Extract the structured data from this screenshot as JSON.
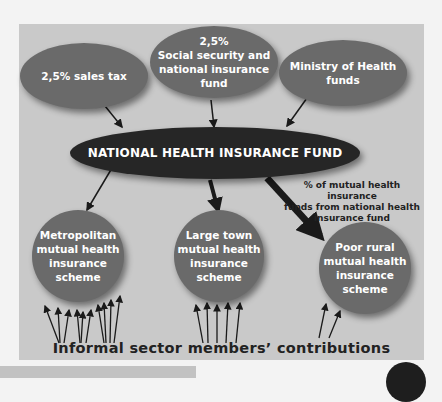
{
  "diagram": {
    "sources": [
      {
        "id": "sales-tax",
        "label": "2,5% sales tax"
      },
      {
        "id": "social-security",
        "label": "2,5%\nSocial security and national insurance fund",
        "line1": "2,5%",
        "line2": "Social security and",
        "line3": "national insurance",
        "line4": "fund"
      },
      {
        "id": "ministry",
        "label": "Ministry of Health funds",
        "line1": "Ministry of Health",
        "line2": "funds"
      }
    ],
    "central": {
      "label": "NATIONAL HEALTH INSURANCE FUND"
    },
    "schemes": [
      {
        "id": "metropolitan",
        "lines": [
          "Metropolitan",
          "mutual health",
          "insurance",
          "scheme"
        ]
      },
      {
        "id": "large-town",
        "lines": [
          "Large town",
          "mutual health",
          "insurance",
          "scheme"
        ]
      },
      {
        "id": "poor-rural",
        "lines": [
          "Poor rural",
          "mutual health",
          "insurance",
          "scheme"
        ]
      }
    ],
    "annotation": {
      "lines": [
        "% of mutual health insurance",
        "funds from national health",
        "insurance fund"
      ]
    },
    "footer": "Informal sector members’ contributions",
    "colors": {
      "panel": "#c9c9c9",
      "ellipse": "#6a6a6a",
      "central": "#262626",
      "text_light": "#ffffff",
      "text_dark": "#222222"
    }
  }
}
